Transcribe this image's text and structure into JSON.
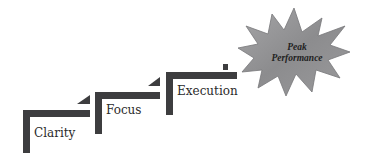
{
  "diagram": {
    "colors": {
      "step": "#3d3d3f",
      "star_fill": "#8e8e90",
      "star_fill_light": "#b3b3b5",
      "star_stroke": "#6a6a6c",
      "text": "#2b2b2b",
      "background": "#ffffff"
    },
    "steps": [
      {
        "label": "Clarity"
      },
      {
        "label": "Focus"
      },
      {
        "label": "Execution"
      }
    ],
    "goal": {
      "line1": "Peak",
      "line2": "Performance",
      "shape": "starburst-icon"
    }
  }
}
